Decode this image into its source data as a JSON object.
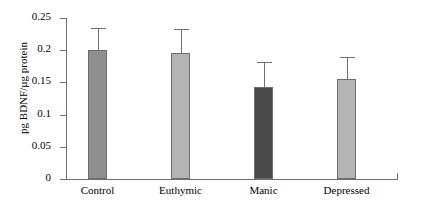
{
  "chart_data": {
    "type": "bar",
    "title": "",
    "xlabel": "",
    "ylabel": "pg BDNF/µg protein",
    "categories": [
      "Control",
      "Euthymic",
      "Manic",
      "Depressed"
    ],
    "values": [
      0.2,
      0.195,
      0.143,
      0.155
    ],
    "errors": [
      0.035,
      0.038,
      0.038,
      0.035
    ],
    "error_type": "upper-only",
    "ylim": [
      0,
      0.25
    ],
    "yticks": [
      0,
      0.05,
      0.1,
      0.15,
      0.2,
      0.25
    ],
    "ytick_labels": [
      "0",
      "0.05",
      "0.1",
      "0.15",
      "0.2",
      "0.25"
    ],
    "grid": false,
    "legend": false,
    "bar_colors": [
      "#8f8f8f",
      "#b4b4b4",
      "#4a4a4a",
      "#b4b4b4"
    ],
    "bar_edge_color": "#6d6d6d",
    "axis_color": "#6f6f6f"
  },
  "axis": {
    "y_label": "pg BDNF/µg protein",
    "ticks": [
      {
        "label": "0.25",
        "value": 0.25
      },
      {
        "label": "0.2",
        "value": 0.2
      },
      {
        "label": "0.15",
        "value": 0.15
      },
      {
        "label": "0.1",
        "value": 0.1
      },
      {
        "label": "0.05",
        "value": 0.05
      },
      {
        "label": "0",
        "value": 0
      }
    ]
  },
  "bars": [
    {
      "label": "Control",
      "value": 0.2,
      "error": 0.035,
      "color": "#8f8f8f"
    },
    {
      "label": "Euthymic",
      "value": 0.195,
      "error": 0.038,
      "color": "#b4b4b4"
    },
    {
      "label": "Manic",
      "value": 0.143,
      "error": 0.038,
      "color": "#4a4a4a"
    },
    {
      "label": "Depressed",
      "value": 0.155,
      "error": 0.035,
      "color": "#b4b4b4"
    }
  ]
}
